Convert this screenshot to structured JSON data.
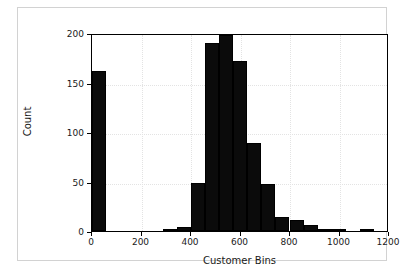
{
  "chart_data": {
    "type": "bar",
    "title": "",
    "subtitle": "",
    "xlabel": "Customer Bins",
    "ylabel": "Count",
    "xlim": [
      0,
      1200
    ],
    "ylim": [
      0,
      200
    ],
    "xticks": [
      0,
      200,
      400,
      600,
      800,
      1000,
      1200
    ],
    "yticks": [
      0,
      50,
      100,
      150,
      200
    ],
    "xtick_labels": [
      "0",
      "200",
      "400",
      "600",
      "800",
      "1000",
      "1200"
    ],
    "ytick_labels": [
      "0",
      "50",
      "100",
      "150",
      "200"
    ],
    "grid": true,
    "grid_style": "dotted",
    "legend": null,
    "bar_color": "#0b0b0b",
    "bin_width": 57,
    "bins": [
      {
        "start": 0,
        "end": 57,
        "count": 162
      },
      {
        "start": 285,
        "end": 342,
        "count": 2
      },
      {
        "start": 342,
        "end": 399,
        "count": 4
      },
      {
        "start": 399,
        "end": 456,
        "count": 48
      },
      {
        "start": 456,
        "end": 513,
        "count": 190
      },
      {
        "start": 513,
        "end": 570,
        "count": 198
      },
      {
        "start": 570,
        "end": 627,
        "count": 172
      },
      {
        "start": 627,
        "end": 684,
        "count": 89
      },
      {
        "start": 684,
        "end": 741,
        "count": 47
      },
      {
        "start": 741,
        "end": 798,
        "count": 14
      },
      {
        "start": 798,
        "end": 855,
        "count": 11
      },
      {
        "start": 855,
        "end": 912,
        "count": 6
      },
      {
        "start": 912,
        "end": 969,
        "count": 1
      },
      {
        "start": 969,
        "end": 1026,
        "count": 1
      },
      {
        "start": 1083,
        "end": 1140,
        "count": 2
      }
    ]
  }
}
